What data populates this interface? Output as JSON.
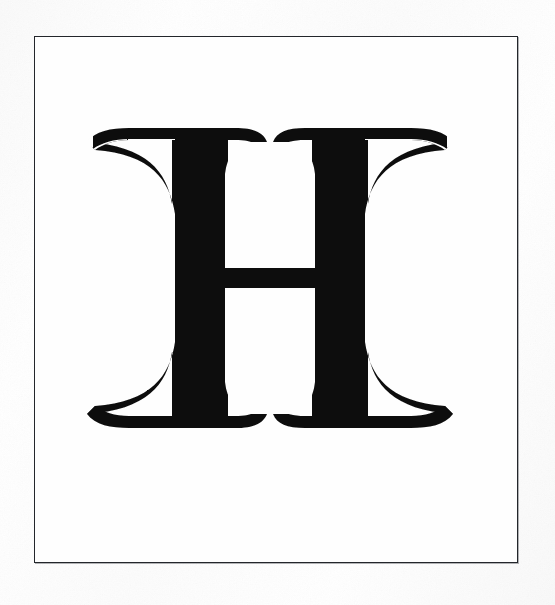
{
  "document": {
    "kind": "scanned-type-specimen-plate",
    "caption": "",
    "glyph": {
      "character": "H",
      "name": "latin-capital-letter-h",
      "style": "didone-fat-face-serif",
      "ink_color": "#0d0d0d"
    }
  },
  "plate": {
    "frame": {
      "name": "ruled-border",
      "stroke_color": "#23262b",
      "stroke_width_px": 1.6,
      "left_px": 34,
      "top_px": 36,
      "width_px": 484,
      "height_px": 527
    },
    "background_color": "#fdfdfd",
    "inner_background_color": "#fefefe"
  },
  "glyph_geometry": {
    "bounds": {
      "left_px": 85,
      "top_px": 128,
      "right_px": 455,
      "bottom_px": 428
    },
    "left_stem": {
      "inner_edge_px": 225,
      "outer_edge_px": 175
    },
    "right_stem": {
      "inner_edge_px": 338,
      "outer_edge_px": 388
    },
    "crossbar": {
      "top_px": 268,
      "bottom_px": 288,
      "thickness_px": 20
    },
    "serif_top_span_px": [
      85,
      455
    ],
    "serif_bottom_span_px": [
      100,
      452
    ]
  }
}
